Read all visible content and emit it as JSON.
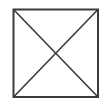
{
  "icon": {
    "name": "crossed-box-placeholder",
    "stroke_color": "#3a3a3a",
    "background_color": "#ffffff",
    "box": {
      "x": 13,
      "y": 9,
      "width": 85,
      "height": 88
    }
  }
}
